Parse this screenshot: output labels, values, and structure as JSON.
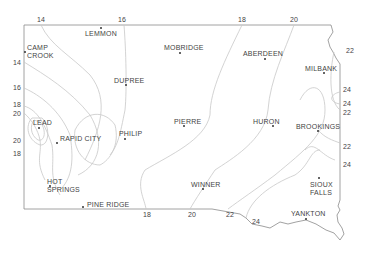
{
  "map": {
    "region": "South Dakota",
    "colors": {
      "border": "#8a8a8a",
      "contour": "#c8c8c8",
      "text": "#444444",
      "dot": "#333333"
    },
    "cities": [
      {
        "name": "LEMMON",
        "x": 101,
        "y": 28,
        "lx": 85,
        "ly": 30
      },
      {
        "name": "CAMP\nCROOK",
        "x": 25,
        "y": 52,
        "lx": 27,
        "ly": 44
      },
      {
        "name": "MOBRIDGE",
        "x": 180,
        "y": 53,
        "lx": 164,
        "ly": 44
      },
      {
        "name": "ABERDEEN",
        "x": 265,
        "y": 59,
        "lx": 243,
        "ly": 50
      },
      {
        "name": "MILBANK",
        "x": 324,
        "y": 73,
        "lx": 305,
        "ly": 65
      },
      {
        "name": "DUPREE",
        "x": 126,
        "y": 85,
        "lx": 114,
        "ly": 77
      },
      {
        "name": "LEAD",
        "x": 39,
        "y": 128,
        "lx": 33,
        "ly": 119
      },
      {
        "name": "RAPID CITY",
        "x": 57,
        "y": 143,
        "lx": 60,
        "ly": 135
      },
      {
        "name": "PHILIP",
        "x": 125,
        "y": 139,
        "lx": 119,
        "ly": 130
      },
      {
        "name": "PIERRE",
        "x": 184,
        "y": 126,
        "lx": 174,
        "ly": 118
      },
      {
        "name": "HURON",
        "x": 273,
        "y": 126,
        "lx": 253,
        "ly": 118
      },
      {
        "name": "BROOKINGS",
        "x": 318,
        "y": 131,
        "lx": 296,
        "ly": 123
      },
      {
        "name": "HOT\nSPRINGS",
        "x": 50,
        "y": 186,
        "lx": 47,
        "ly": 178
      },
      {
        "name": "WINNER",
        "x": 203,
        "y": 189,
        "lx": 191,
        "ly": 181
      },
      {
        "name": "SIOUX\nFALLS",
        "x": 319,
        "y": 178,
        "lx": 310,
        "ly": 181
      },
      {
        "name": "PINE RIDGE",
        "x": 83,
        "y": 207,
        "lx": 87,
        "ly": 201
      },
      {
        "name": "YANKTON",
        "x": 306,
        "y": 219,
        "lx": 291,
        "ly": 210
      }
    ],
    "contour_labels": [
      {
        "value": "14",
        "x": 37,
        "y": 16
      },
      {
        "value": "16",
        "x": 118,
        "y": 16
      },
      {
        "value": "18",
        "x": 238,
        "y": 16
      },
      {
        "value": "20",
        "x": 290,
        "y": 16
      },
      {
        "value": "22",
        "x": 346,
        "y": 47
      },
      {
        "value": "14",
        "x": 13,
        "y": 59
      },
      {
        "value": "16",
        "x": 13,
        "y": 84
      },
      {
        "value": "18",
        "x": 13,
        "y": 101
      },
      {
        "value": "20",
        "x": 13,
        "y": 110
      },
      {
        "value": "24",
        "x": 343,
        "y": 86
      },
      {
        "value": "24",
        "x": 343,
        "y": 100
      },
      {
        "value": "22",
        "x": 343,
        "y": 109
      },
      {
        "value": "20",
        "x": 13,
        "y": 137
      },
      {
        "value": "18",
        "x": 13,
        "y": 150
      },
      {
        "value": "22",
        "x": 343,
        "y": 143
      },
      {
        "value": "24",
        "x": 343,
        "y": 161
      },
      {
        "value": "18",
        "x": 143,
        "y": 211
      },
      {
        "value": "20",
        "x": 188,
        "y": 211
      },
      {
        "value": "22",
        "x": 226,
        "y": 211
      },
      {
        "value": "24",
        "x": 252,
        "y": 218
      }
    ]
  }
}
